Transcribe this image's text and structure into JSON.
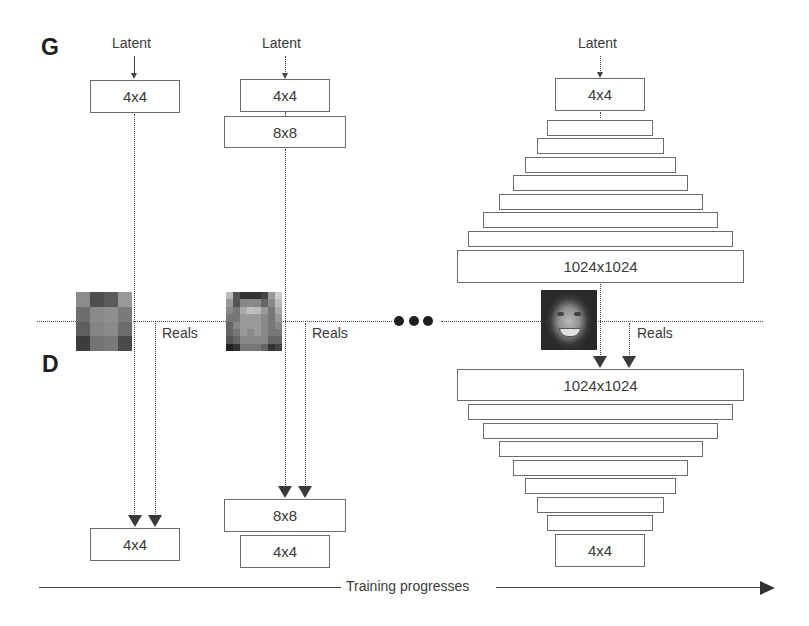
{
  "labels": {
    "generator": "G",
    "discriminator": "D",
    "latent": "Latent",
    "reals": "Reals",
    "training": "Training progresses"
  },
  "columns": [
    {
      "stage": "4x4",
      "generator_layers": [
        "4x4"
      ],
      "discriminator_layers": [
        "4x4"
      ],
      "sample_image": "4x4 pixelated face"
    },
    {
      "stage": "8x8",
      "generator_layers": [
        "4x4",
        "8x8"
      ],
      "discriminator_layers": [
        "8x8",
        "4x4"
      ],
      "sample_image": "8x8 pixelated face"
    },
    {
      "stage": "1024x1024",
      "generator_layers": [
        "4x4",
        "",
        "",
        "",
        "",
        "",
        "",
        "",
        "1024x1024"
      ],
      "discriminator_layers": [
        "1024x1024",
        "",
        "",
        "",
        "",
        "",
        "",
        "",
        "4x4"
      ],
      "sample_image": "1024x1024 face photo"
    }
  ],
  "ellipsis": "•••",
  "colors": {
    "line": "#444444",
    "box_border": "#6a6a6a",
    "text": "#3a3a3a"
  }
}
